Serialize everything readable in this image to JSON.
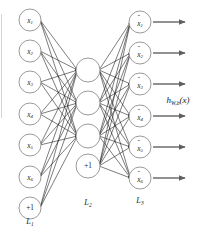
{
  "diagram": {
    "background_color": "#ffffff",
    "node_stroke_color": "#8e8e8e",
    "edge_color": "#111111",
    "arrow_color": "#6d6d6d",
    "text_color": "#1a1a1a",
    "output_function": {
      "base": "h",
      "subscript": "W,b",
      "argument": "(x)",
      "full": "h_{W,b}(x)"
    },
    "layers": [
      {
        "id": "input-layer",
        "label_base": "L",
        "label_sub": "1",
        "label_full": "L1",
        "x": 30,
        "label_y": 222,
        "radius": 11,
        "nodes": [
          {
            "id": "input-node-1",
            "base": "x",
            "sub": "1",
            "hat": false,
            "bias": false,
            "y": 20
          },
          {
            "id": "input-node-2",
            "base": "x",
            "sub": "2",
            "hat": false,
            "bias": false,
            "y": 51
          },
          {
            "id": "input-node-3",
            "base": "x",
            "sub": "3",
            "hat": false,
            "bias": false,
            "y": 82
          },
          {
            "id": "input-node-4",
            "base": "x",
            "sub": "4",
            "hat": false,
            "bias": false,
            "y": 114
          },
          {
            "id": "input-node-5",
            "base": "x",
            "sub": "5",
            "hat": false,
            "bias": false,
            "y": 145
          },
          {
            "id": "input-node-6",
            "base": "x",
            "sub": "6",
            "hat": false,
            "bias": false,
            "y": 177
          },
          {
            "id": "input-bias-node",
            "base": "+1",
            "sub": "",
            "hat": false,
            "bias": true,
            "y": 208
          }
        ]
      },
      {
        "id": "hidden-layer",
        "label_base": "L",
        "label_sub": "2",
        "label_full": "L2",
        "x": 88,
        "label_y": 203,
        "radius": 12,
        "nodes": [
          {
            "id": "hidden-node-1",
            "base": "",
            "sub": "",
            "hat": false,
            "bias": false,
            "y": 70
          },
          {
            "id": "hidden-node-2",
            "base": "",
            "sub": "",
            "hat": false,
            "bias": false,
            "y": 103
          },
          {
            "id": "hidden-node-3",
            "base": "",
            "sub": "",
            "hat": false,
            "bias": false,
            "y": 136
          },
          {
            "id": "hidden-bias-node",
            "base": "+1",
            "sub": "",
            "hat": false,
            "bias": true,
            "y": 166
          }
        ]
      },
      {
        "id": "output-layer",
        "label_base": "L",
        "label_sub": "3",
        "label_full": "L3",
        "x": 140,
        "label_y": 201,
        "radius": 11,
        "nodes": [
          {
            "id": "output-node-1",
            "base": "x",
            "sub": "1",
            "hat": true,
            "bias": false,
            "y": 22
          },
          {
            "id": "output-node-2",
            "base": "x",
            "sub": "2",
            "hat": true,
            "bias": false,
            "y": 53
          },
          {
            "id": "output-node-3",
            "base": "x",
            "sub": "3",
            "hat": true,
            "bias": false,
            "y": 84
          },
          {
            "id": "output-node-4",
            "base": "x",
            "sub": "4",
            "hat": true,
            "bias": false,
            "y": 116
          },
          {
            "id": "output-node-5",
            "base": "x",
            "sub": "5",
            "hat": true,
            "bias": false,
            "y": 147
          },
          {
            "id": "output-node-6",
            "base": "x",
            "sub": "6",
            "hat": true,
            "bias": false,
            "y": 178
          }
        ]
      }
    ],
    "output_arrows": [
      {
        "id": "output-arrow-1",
        "y": 22,
        "x_start": 153,
        "x_end": 185
      },
      {
        "id": "output-arrow-2",
        "y": 53,
        "x_start": 153,
        "x_end": 185
      },
      {
        "id": "output-arrow-3",
        "y": 84,
        "x_start": 153,
        "x_end": 185
      },
      {
        "id": "output-arrow-4",
        "y": 116,
        "x_start": 153,
        "x_end": 185
      },
      {
        "id": "output-arrow-5",
        "y": 147,
        "x_start": 153,
        "x_end": 185
      },
      {
        "id": "output-arrow-6",
        "y": 178,
        "x_start": 153,
        "x_end": 185
      }
    ],
    "function_label_position": {
      "x": 178,
      "y": 101
    }
  }
}
